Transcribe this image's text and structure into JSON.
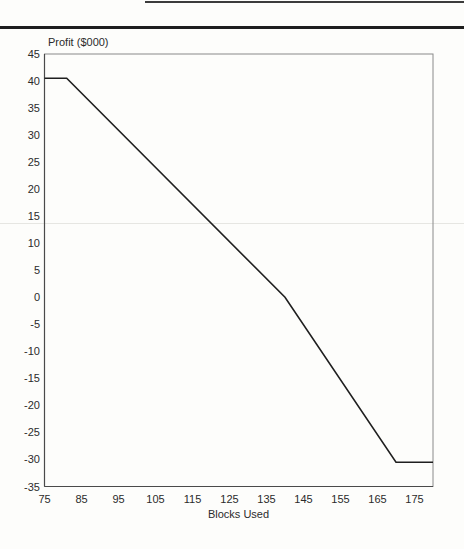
{
  "page": {
    "background_color": "#fdfdfb",
    "top_partial_rule_color": "#3c3c3c",
    "top_rule_color": "#1e1e1e",
    "scan_artifact_line_color": "#e6e6e2"
  },
  "chart_data": {
    "type": "line",
    "title": "",
    "y_axis_title": "Profit ($000)",
    "x_axis_title": "Blocks Used",
    "xlim": [
      75,
      180
    ],
    "ylim": [
      -35,
      45
    ],
    "x_ticks": [
      75,
      85,
      95,
      105,
      115,
      125,
      135,
      145,
      155,
      165,
      175
    ],
    "y_ticks": [
      45,
      40,
      35,
      30,
      25,
      20,
      15,
      10,
      5,
      0,
      -5,
      -10,
      -15,
      -20,
      -25,
      -30,
      -35
    ],
    "grid": false,
    "legend_position": "none",
    "frame_color": "#8a8a8a",
    "axis_color": "#4a4a4a",
    "series": [
      {
        "name": "Profit",
        "color": "#1f1f1f",
        "points": [
          [
            75,
            40.5
          ],
          [
            81,
            40.5
          ],
          [
            140,
            0
          ],
          [
            170,
            -30.5
          ],
          [
            180,
            -30.5
          ]
        ]
      }
    ]
  }
}
